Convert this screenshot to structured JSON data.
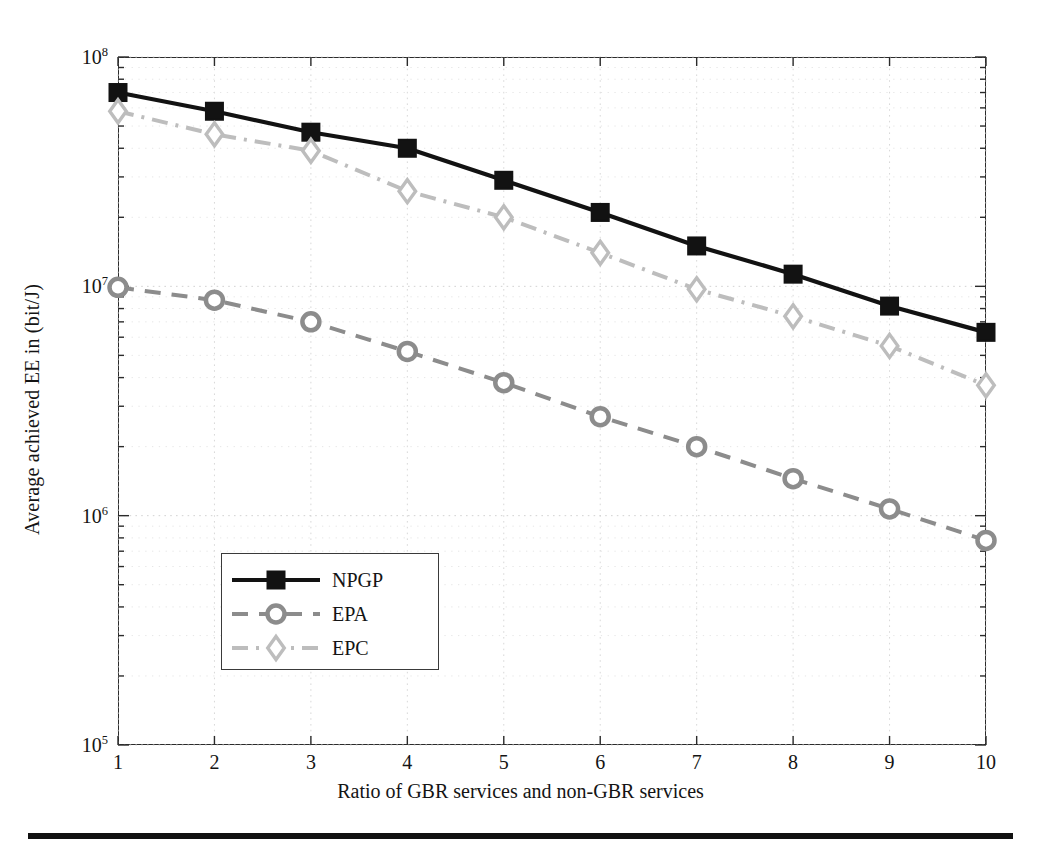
{
  "figure": {
    "background": "#ffffff",
    "footer_rule_color": "#111111"
  },
  "axes": {
    "xlabel": "Ratio of GBR services and non-GBR services",
    "ylabel": "Average achieved EE in (bit/J)",
    "x_ticks": [
      "1",
      "2",
      "3",
      "4",
      "5",
      "6",
      "7",
      "8",
      "9",
      "10"
    ],
    "y_ticks": [
      {
        "mantissa": "10",
        "exponent": "5"
      },
      {
        "mantissa": "10",
        "exponent": "6"
      },
      {
        "mantissa": "10",
        "exponent": "7"
      },
      {
        "mantissa": "10",
        "exponent": "8"
      }
    ]
  },
  "legend": {
    "position": "lower-left-inside",
    "entries": [
      {
        "label": "NPGP",
        "color": "#121212",
        "marker": "square",
        "dash": "solid"
      },
      {
        "label": "EPA",
        "color": "#8c8c8c",
        "marker": "circle",
        "dash": "dashed"
      },
      {
        "label": "EPC",
        "color": "#bdbdbd",
        "marker": "diamond",
        "dash": "dashdot"
      }
    ]
  },
  "chart_data": {
    "type": "line",
    "title": "",
    "subtitle": "",
    "xlabel": "Ratio of GBR services and non-GBR services",
    "ylabel": "Average achieved EE in (bit/J)",
    "yscale": "log",
    "xscale": "linear",
    "xlim": [
      1,
      10
    ],
    "ylim": [
      100000,
      100000000
    ],
    "grid": true,
    "grid_style": "dotted",
    "legend_position": "lower left",
    "x": [
      1,
      2,
      3,
      4,
      5,
      6,
      7,
      8,
      9,
      10
    ],
    "series": [
      {
        "name": "NPGP",
        "color": "#121212",
        "marker": "square",
        "dash": "solid",
        "values": [
          70000000,
          58000000,
          47000000,
          40000000,
          29000000,
          21000000,
          15000000,
          11300000,
          8200000,
          6300000
        ]
      },
      {
        "name": "EPA",
        "color": "#8c8c8c",
        "marker": "circle",
        "dash": "dashed",
        "values": [
          9900000,
          8700000,
          7000000,
          5200000,
          3800000,
          2700000,
          2000000,
          1450000,
          1070000,
          780000
        ]
      },
      {
        "name": "EPC",
        "color": "#bdbdbd",
        "marker": "diamond",
        "dash": "dashdot",
        "values": [
          58000000,
          46000000,
          39000000,
          26000000,
          20000000,
          14000000,
          9700000,
          7400000,
          5500000,
          3700000
        ]
      }
    ]
  }
}
